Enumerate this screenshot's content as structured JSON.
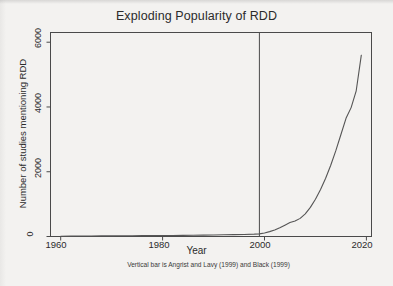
{
  "figure": {
    "title": "Exploding Popularity of RDD",
    "xlabel": "Year",
    "ylabel": "Number of studies mentioning RDD",
    "caption": "Vertical bar is Angrist and Lavy (1999) and Black (1999)",
    "line_color": "#555555",
    "axis_color": "#3a3a3a",
    "background": "#f3f2f0"
  },
  "ticks": {
    "y": [
      "0",
      "2000",
      "4000",
      "6000"
    ],
    "x": [
      "1960",
      "1980",
      "2000",
      "2020"
    ]
  },
  "chart_data": {
    "type": "line",
    "title": "Exploding Popularity of RDD",
    "xlabel": "Year",
    "ylabel": "Number of studies mentioning RDD",
    "subtitle": "Vertical bar is Angrist and Lavy (1999) and Black (1999)",
    "xlim": [
      1958,
      2021
    ],
    "ylim": [
      0,
      6300
    ],
    "xticks": [
      1960,
      1980,
      2000,
      2020
    ],
    "yticks": [
      0,
      2000,
      4000,
      6000
    ],
    "grid": false,
    "legend": null,
    "annotations": [
      {
        "type": "vline",
        "x": 1999,
        "label": "Angrist and Lavy (1999) and Black (1999)"
      }
    ],
    "series": [
      {
        "name": "Studies mentioning RDD",
        "x": [
          1960,
          1962,
          1964,
          1966,
          1968,
          1970,
          1972,
          1974,
          1976,
          1978,
          1980,
          1982,
          1984,
          1986,
          1988,
          1990,
          1992,
          1994,
          1996,
          1998,
          1999,
          2000,
          2001,
          2002,
          2003,
          2004,
          2005,
          2006,
          2007,
          2008,
          2009,
          2010,
          2011,
          2012,
          2013,
          2014,
          2015,
          2016,
          2017,
          2018,
          2019
        ],
        "y": [
          10,
          12,
          14,
          16,
          18,
          20,
          22,
          24,
          26,
          28,
          30,
          33,
          36,
          40,
          44,
          48,
          52,
          58,
          64,
          72,
          80,
          110,
          150,
          200,
          270,
          350,
          430,
          480,
          560,
          700,
          900,
          1150,
          1450,
          1800,
          2200,
          2650,
          3150,
          3650,
          3980,
          4500,
          5600
        ]
      }
    ]
  }
}
